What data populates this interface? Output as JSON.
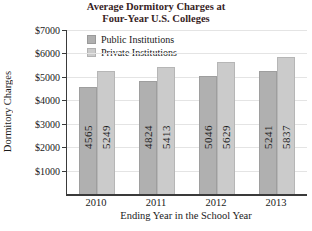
{
  "figure": {
    "title_line1": "Average Dormitory Charges at",
    "title_line2": "Four-Year U.S. Colleges"
  },
  "chart_data": {
    "type": "bar",
    "title": "Average Dormitory Charges at Four-Year U.S. Colleges",
    "xlabel": "Ending Year in the School Year",
    "ylabel": "Dormitory Charges",
    "categories": [
      "2010",
      "2011",
      "2012",
      "2013"
    ],
    "series": [
      {
        "name": "Public Institutions",
        "color": "#b0b0b0",
        "values": [
          4565,
          4824,
          5046,
          5241
        ]
      },
      {
        "name": "Private Institutions",
        "color": "#cbcbcb",
        "values": [
          5249,
          5413,
          5629,
          5837
        ]
      }
    ],
    "ylim": [
      0,
      7000
    ],
    "ytick_interval": 1000,
    "yticks": [
      "$1000",
      "$2000",
      "$3000",
      "$4000",
      "$5000",
      "$6000",
      "$7000"
    ],
    "grid": "horizontal",
    "gridline_color": "#e4e4e4",
    "legend_position": "top-left-inside",
    "bar_value_labels": "rotated-inside",
    "value_label_color": "#1c1c1c",
    "axis_color": "#3a3a3a",
    "title_color": "#38241f"
  }
}
